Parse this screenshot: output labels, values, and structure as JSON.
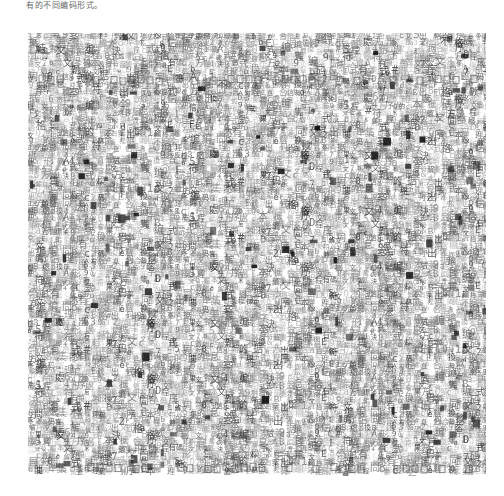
{
  "document": {
    "caption": "有的不同编码形式。"
  },
  "figure": {
    "glyphs": "編码形式不同有的字符集合文本數据信息编碼標準轉換程序處理結果輸出格式兼容問題解決方案",
    "ink_color": "#3a3a3a",
    "background": "#ffffff"
  }
}
